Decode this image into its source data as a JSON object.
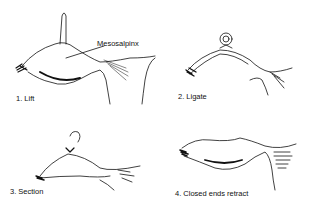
{
  "figure": {
    "panels": [
      {
        "step": "1. Lift",
        "annotation": "Mesosalpinx"
      },
      {
        "step": "2. Ligate"
      },
      {
        "step": "3. Section"
      },
      {
        "step": "4. Closed ends retract"
      }
    ]
  }
}
